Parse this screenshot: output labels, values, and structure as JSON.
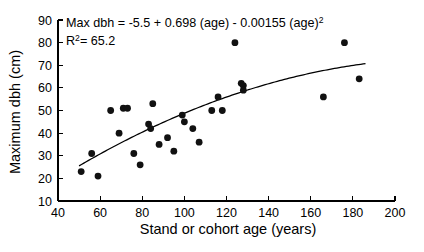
{
  "chart_data": {
    "type": "scatter",
    "title": "",
    "xlabel": "Stand or cohort age (years)",
    "ylabel": "Maximum dbh (cm)",
    "xlim": [
      40,
      200
    ],
    "ylim": [
      10,
      90
    ],
    "xticks": [
      40,
      60,
      80,
      100,
      120,
      140,
      160,
      180,
      200
    ],
    "yticks": [
      10,
      20,
      30,
      40,
      50,
      60,
      70,
      80,
      90
    ],
    "xtick_labels": [
      "40",
      "60",
      "80",
      "100",
      "120",
      "140",
      "160",
      "180",
      "200"
    ],
    "ytick_labels": [
      "10",
      "20",
      "30",
      "40",
      "50",
      "60",
      "70",
      "80",
      "90"
    ],
    "grid": false,
    "legend": "none",
    "marker": "filled-circle",
    "marker_color": "#111111",
    "curve_color": "#000000",
    "points": [
      {
        "x": 51,
        "y": 23
      },
      {
        "x": 56,
        "y": 31
      },
      {
        "x": 59,
        "y": 21
      },
      {
        "x": 65,
        "y": 50
      },
      {
        "x": 69,
        "y": 40
      },
      {
        "x": 71,
        "y": 51
      },
      {
        "x": 73,
        "y": 51
      },
      {
        "x": 76,
        "y": 31
      },
      {
        "x": 79,
        "y": 26
      },
      {
        "x": 83,
        "y": 44
      },
      {
        "x": 84,
        "y": 42
      },
      {
        "x": 85,
        "y": 53
      },
      {
        "x": 88,
        "y": 35
      },
      {
        "x": 92,
        "y": 38
      },
      {
        "x": 95,
        "y": 32
      },
      {
        "x": 99,
        "y": 48
      },
      {
        "x": 100,
        "y": 45
      },
      {
        "x": 104,
        "y": 42
      },
      {
        "x": 107,
        "y": 36
      },
      {
        "x": 113,
        "y": 50
      },
      {
        "x": 116,
        "y": 56
      },
      {
        "x": 118,
        "y": 50
      },
      {
        "x": 124,
        "y": 80
      },
      {
        "x": 127,
        "y": 62
      },
      {
        "x": 128,
        "y": 61
      },
      {
        "x": 128,
        "y": 59
      },
      {
        "x": 166,
        "y": 56
      },
      {
        "x": 176,
        "y": 80
      },
      {
        "x": 183,
        "y": 64
      }
    ],
    "fit": {
      "kind": "quadratic",
      "intercept": -5.5,
      "linear_coef": 0.698,
      "quadratic_coef": -0.00155,
      "x_start": 50,
      "x_end": 186
    },
    "annotations": {
      "equation_prefix": "Max dbh = -5.5 + 0.698 (age) - 0.00155 (age)",
      "equation_exponent": "2",
      "r_label": "R",
      "r_exponent": "2",
      "r_value": "= 65.2"
    }
  }
}
